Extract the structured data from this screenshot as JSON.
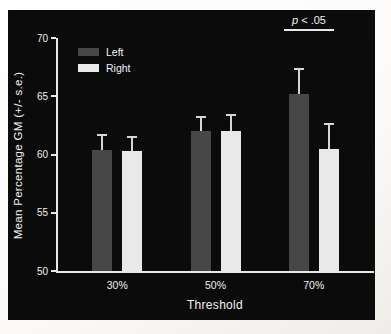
{
  "figure": {
    "annotation": {
      "p_symbol": "p",
      "comparison": " < .05",
      "full": "p < .05"
    }
  },
  "chart_data": {
    "type": "bar",
    "title": "",
    "xlabel": "Threshold",
    "ylabel": "Mean Percentage GM (+/- s.e.)",
    "categories": [
      "30%",
      "50%",
      "70%"
    ],
    "series": [
      {
        "name": "Left",
        "color": "#474747",
        "values": [
          60.4,
          62.0,
          65.2
        ],
        "errors": [
          1.3,
          1.2,
          2.1
        ]
      },
      {
        "name": "Right",
        "color": "#e9e9e9",
        "values": [
          60.3,
          62.0,
          60.5
        ],
        "errors": [
          1.2,
          1.4,
          2.1
        ]
      }
    ],
    "ylim": [
      50,
      70
    ],
    "yticks": [
      70,
      65,
      60,
      55,
      50
    ],
    "grid": false,
    "legend_position": "upper-left",
    "annotation": "p < .05",
    "error_direction": "upper-only",
    "colors": {
      "panel_background": "#0b0b0b",
      "axis": "#e8e8e8",
      "text": "#f0f0f0",
      "error_bar": "#d6d6d6",
      "frame_background": "#fbfaf8"
    }
  }
}
